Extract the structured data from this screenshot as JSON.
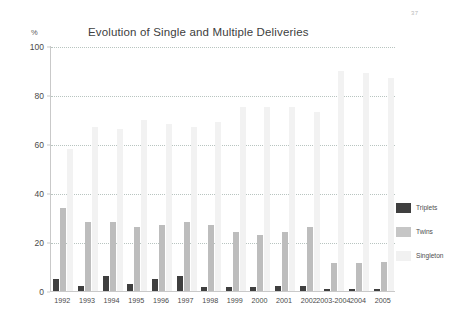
{
  "page_mark": "37",
  "chart_data": {
    "type": "bar",
    "title": "Evolution of Single and Multiple Deliveries",
    "xlabel": "",
    "ylabel": "",
    "unit_label": "%",
    "ylim": [
      0,
      100
    ],
    "yticks": [
      0,
      20,
      40,
      60,
      80,
      100
    ],
    "grid": true,
    "legend_position": "right",
    "categories": [
      "1992",
      "1993",
      "1994",
      "1995",
      "1996",
      "1997",
      "1998",
      "1999",
      "2000",
      "2001",
      "2002",
      "2003",
      "2004",
      "2005"
    ],
    "xtick_labels": [
      "1992",
      "1993",
      "1994",
      "1995",
      "1996",
      "1997",
      "1998",
      "1999",
      "2000",
      "2001",
      "2002",
      "2003-2004",
      "2004",
      "2005"
    ],
    "series": [
      {
        "name": "Triplets",
        "color": "#3f3f3f",
        "values": [
          5,
          2,
          6,
          3,
          5,
          6,
          1.5,
          1.5,
          1.5,
          2,
          2,
          1,
          1,
          1
        ]
      },
      {
        "name": "Twins",
        "color": "#bdbdbd",
        "values": [
          34,
          28,
          28,
          26,
          27,
          28,
          27,
          24,
          23,
          24,
          26,
          11.5,
          11.5,
          12
        ]
      },
      {
        "name": "Singleton",
        "color": "#f2f2f2",
        "values": [
          58,
          67,
          66,
          70,
          68,
          67,
          69,
          75,
          75,
          75,
          73,
          90,
          89,
          87
        ]
      }
    ]
  },
  "legend": {
    "items": [
      {
        "label": "Triplets"
      },
      {
        "label": "Twins"
      },
      {
        "label": "Singleton"
      }
    ]
  }
}
